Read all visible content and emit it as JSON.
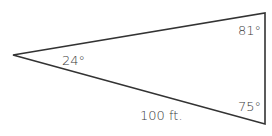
{
  "diagram": {
    "type": "triangle",
    "stroke_color": "#333333",
    "vertices": {
      "left": [
        13,
        55
      ],
      "top_right": [
        265,
        13
      ],
      "bottom_right": [
        265,
        124
      ]
    },
    "top_side_label": "??? ft.",
    "bottom_side_label": "100 ft.",
    "angles": {
      "left": "24°",
      "top_right": "81°",
      "bottom_right": "75°"
    }
  }
}
